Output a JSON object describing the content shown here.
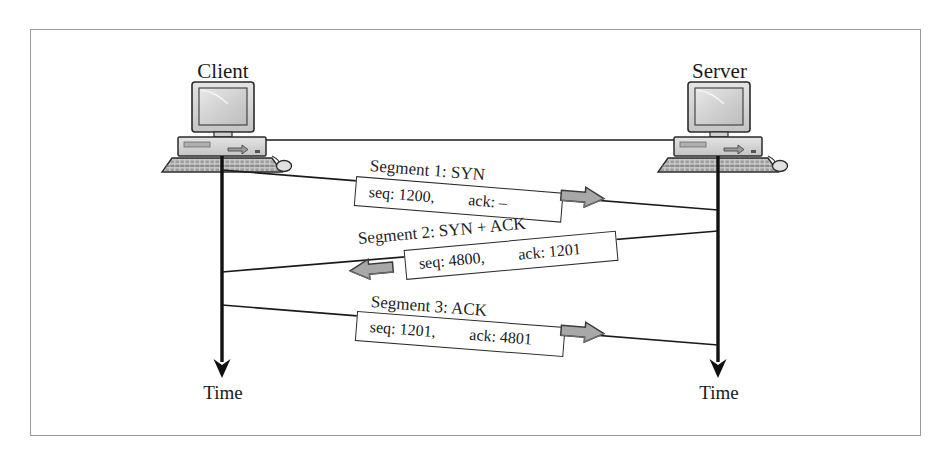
{
  "figure": {
    "type": "tcp-three-way-handshake",
    "page_bleed_top": "",
    "page_bleed_bottom": ""
  },
  "nodes": {
    "client": {
      "label": "Client",
      "icon": "desktop-computer-icon",
      "time_axis_label": "Time"
    },
    "server": {
      "label": "Server",
      "icon": "desktop-computer-icon",
      "time_axis_label": "Time"
    }
  },
  "segments": [
    {
      "id": "segment-1",
      "title": "Segment 1: SYN",
      "seq": "seq: 1200,",
      "ack": "ack: –",
      "direction": "client-to-server",
      "arrow_icon": "block-arrow-right-icon"
    },
    {
      "id": "segment-2",
      "title": "Segment 2: SYN + ACK",
      "seq": "seq: 4800,",
      "ack": "ack: 1201",
      "direction": "server-to-client",
      "arrow_icon": "block-arrow-left-icon"
    },
    {
      "id": "segment-3",
      "title": "Segment 3: ACK",
      "seq": "seq: 1201,",
      "ack": "ack: 4801",
      "direction": "client-to-server",
      "arrow_icon": "block-arrow-right-icon"
    }
  ],
  "colors": {
    "frame_border": "#9a9a9a",
    "line": "#1a1a1a",
    "arrow_fill": "#a8a8a8",
    "arrow_stroke": "#3a3a3a",
    "background": "#ffffff",
    "screen_fill": "#d2d2d2",
    "case_fill": "#d8d8d8"
  }
}
